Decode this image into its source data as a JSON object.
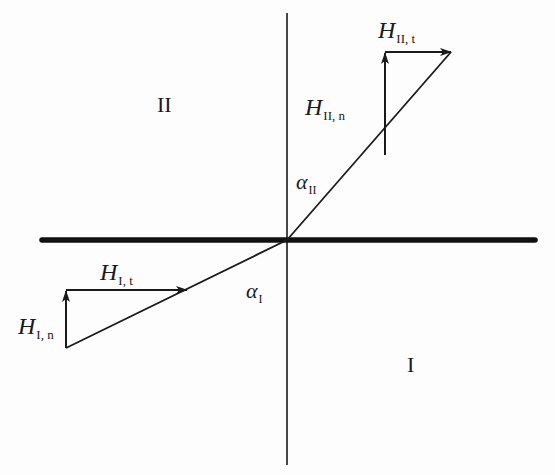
{
  "diagram": {
    "regions": {
      "upper": "II",
      "lower": "I"
    },
    "boundary": {
      "description": "thick horizontal interface line",
      "x1": 42,
      "x2": 535,
      "y": 240,
      "thickness": 5
    },
    "normal_axis": {
      "x": 287,
      "y1": 13,
      "y2": 465
    },
    "origin": {
      "x": 287,
      "y": 240
    },
    "vectors": {
      "upper": {
        "resultant_end": {
          "x": 451,
          "y": 52
        },
        "component_base": {
          "x": 385,
          "y": 155
        },
        "normal_label": {
          "main": "H",
          "sub": "II, n"
        },
        "tangent_label": {
          "main": "H",
          "sub": "II, t"
        },
        "angle_label": {
          "main": "α",
          "sub": "II"
        }
      },
      "lower": {
        "resultant_start": {
          "x": 66,
          "y": 348
        },
        "component_top": {
          "x": 66,
          "y": 290
        },
        "tangent_end": {
          "x": 187,
          "y": 290
        },
        "normal_label": {
          "main": "H",
          "sub": "I, n"
        },
        "tangent_label": {
          "main": "H",
          "sub": "I, t"
        },
        "angle_label": {
          "main": "α",
          "sub": "I"
        }
      }
    },
    "colors": {
      "ink": "#1a1a1a",
      "background": "#fdfdfd"
    }
  }
}
